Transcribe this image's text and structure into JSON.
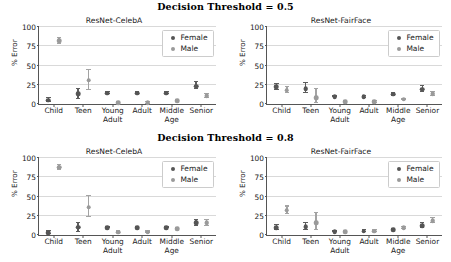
{
  "figure": {
    "panels": [
      {
        "suptitle": "Decision Threshold = 0.5",
        "charts": [
          {
            "title": "ResNet-CelebA",
            "legend": {
              "female": "Female",
              "male": "Male"
            }
          },
          {
            "title": "ResNet-FairFace",
            "legend": {
              "female": "Female",
              "male": "Male"
            }
          }
        ]
      },
      {
        "suptitle": "Decision Threshold = 0.8",
        "charts": [
          {
            "title": "ResNet-CelebA",
            "legend": {
              "female": "Female",
              "male": "Male"
            }
          },
          {
            "title": "ResNet-FairFace",
            "legend": {
              "female": "Female",
              "male": "Male"
            }
          }
        ]
      }
    ]
  },
  "axis": {
    "ylabel": "% Error",
    "yticks": [
      "0",
      "25",
      "50",
      "75",
      "100"
    ],
    "xticks": [
      "Child",
      "Teen",
      "Young\nAdult",
      "Adult",
      "Middle\nAge",
      "Senior"
    ]
  },
  "colors": {
    "female": "#555555",
    "male": "#9a9a9a",
    "grid": "#d9d9d9",
    "axis": "#555555",
    "background": "#ffffff"
  },
  "chart_data": [
    {
      "type": "scatter",
      "title": "ResNet-CelebA",
      "subtitle": "Decision Threshold = 0.5",
      "xlabel": "",
      "ylabel": "% Error",
      "ylim": [
        0,
        100
      ],
      "yticks": [
        0,
        25,
        50,
        75,
        100
      ],
      "grid": true,
      "legend_position": "upper right",
      "categories": [
        "Child",
        "Teen",
        "Young Adult",
        "Adult",
        "Middle Age",
        "Senior"
      ],
      "series": [
        {
          "name": "Female",
          "values": [
            5,
            13,
            14,
            14,
            14,
            23
          ],
          "err_low": [
            3,
            6,
            1,
            1,
            1,
            4
          ],
          "err_high": [
            3,
            7,
            1,
            1,
            1,
            5
          ]
        },
        {
          "name": "Male",
          "values": [
            82,
            31,
            1.5,
            1.5,
            4.5,
            10.5
          ],
          "err_low": [
            4,
            13,
            1,
            1,
            1,
            3
          ],
          "err_high": [
            4,
            13,
            1,
            1,
            1,
            3
          ]
        }
      ]
    },
    {
      "type": "scatter",
      "title": "ResNet-FairFace",
      "subtitle": "Decision Threshold = 0.5",
      "xlabel": "",
      "ylabel": "% Error",
      "ylim": [
        0,
        100
      ],
      "yticks": [
        0,
        25,
        50,
        75,
        100
      ],
      "grid": true,
      "legend_position": "upper right",
      "categories": [
        "Child",
        "Teen",
        "Young Adult",
        "Adult",
        "Middle Age",
        "Senior"
      ],
      "series": [
        {
          "name": "Female",
          "values": [
            22,
            20,
            9.5,
            9,
            12.5,
            19
          ],
          "err_low": [
            4,
            6,
            1,
            1,
            1.5,
            4
          ],
          "err_high": [
            4,
            7,
            1,
            1,
            1.5,
            4
          ]
        },
        {
          "name": "Male",
          "values": [
            18,
            8,
            2.5,
            2.5,
            6,
            13
          ],
          "err_low": [
            4,
            7,
            1,
            1,
            1,
            3
          ],
          "err_high": [
            4,
            12,
            1,
            1,
            1,
            3
          ]
        }
      ]
    },
    {
      "type": "scatter",
      "title": "ResNet-CelebA",
      "subtitle": "Decision Threshold = 0.8",
      "xlabel": "",
      "ylabel": "% Error",
      "ylim": [
        0,
        100
      ],
      "yticks": [
        0,
        25,
        50,
        75,
        100
      ],
      "grid": true,
      "legend_position": "upper right",
      "categories": [
        "Child",
        "Teen",
        "Young Adult",
        "Adult",
        "Middle Age",
        "Senior"
      ],
      "series": [
        {
          "name": "Female",
          "values": [
            3,
            10,
            9.5,
            9,
            9.5,
            16
          ],
          "err_low": [
            2,
            6,
            1,
            1,
            1,
            4
          ],
          "err_high": [
            2,
            6,
            1,
            1,
            1,
            4
          ]
        },
        {
          "name": "Male",
          "values": [
            88,
            36,
            3.5,
            3.5,
            8,
            16
          ],
          "err_low": [
            3,
            13,
            1,
            1,
            1,
            4
          ],
          "err_high": [
            3,
            15,
            1,
            1,
            1,
            4
          ]
        }
      ]
    },
    {
      "type": "scatter",
      "title": "ResNet-FairFace",
      "subtitle": "Decision Threshold = 0.8",
      "xlabel": "",
      "ylabel": "% Error",
      "ylim": [
        0,
        100
      ],
      "yticks": [
        0,
        25,
        50,
        75,
        100
      ],
      "grid": true,
      "legend_position": "upper right",
      "categories": [
        "Child",
        "Teen",
        "Young Adult",
        "Adult",
        "Middle Age",
        "Senior"
      ],
      "series": [
        {
          "name": "Female",
          "values": [
            9.5,
            11,
            4.5,
            5,
            6.5,
            12
          ],
          "err_low": [
            3,
            4,
            1,
            1,
            1,
            3
          ],
          "err_high": [
            3,
            5,
            1,
            1,
            1,
            3
          ]
        },
        {
          "name": "Male",
          "values": [
            32,
            16,
            4.5,
            5,
            9,
            18.5
          ],
          "err_low": [
            5,
            10,
            1,
            1,
            1,
            3
          ],
          "err_high": [
            5,
            12,
            1,
            1,
            1,
            3
          ]
        }
      ]
    }
  ]
}
